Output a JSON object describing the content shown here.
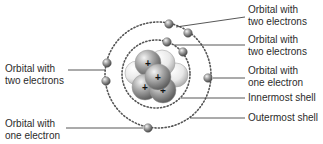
{
  "colors": {
    "line": "#444444",
    "shell_dots": "#555555",
    "text": "#2b2b2b",
    "proton_dark": "#8a8a8a",
    "neutron_light": "#e2e2e2",
    "electron": "#8c8c8c"
  },
  "shells": [
    {
      "name": "innermost-shell",
      "cx": 156,
      "cy": 74,
      "r": 34
    },
    {
      "name": "outermost-shell",
      "cx": 158,
      "cy": 75,
      "r": 53
    }
  ],
  "nucleus": {
    "particles": [
      {
        "type": "neutron",
        "cx": 137,
        "cy": 73,
        "r": 12
      },
      {
        "type": "neutron",
        "cx": 176,
        "cy": 75,
        "r": 12
      },
      {
        "type": "neutron",
        "cx": 162,
        "cy": 63,
        "r": 13
      },
      {
        "type": "proton",
        "cx": 148,
        "cy": 63,
        "r": 13,
        "symbol": "+"
      },
      {
        "type": "proton",
        "cx": 145,
        "cy": 87,
        "r": 13,
        "symbol": "+"
      },
      {
        "type": "proton",
        "cx": 163,
        "cy": 90,
        "r": 13,
        "symbol": "+"
      },
      {
        "type": "proton",
        "cx": 158,
        "cy": 77,
        "r": 13,
        "symbol": "+"
      }
    ]
  },
  "electrons": [
    {
      "cx": 169,
      "cy": 24
    },
    {
      "cx": 188,
      "cy": 33
    },
    {
      "cx": 167,
      "cy": 42
    },
    {
      "cx": 183,
      "cy": 52
    },
    {
      "cx": 107,
      "cy": 63
    },
    {
      "cx": 106,
      "cy": 81
    },
    {
      "cx": 208,
      "cy": 78
    },
    {
      "cx": 148,
      "cy": 128
    }
  ],
  "labels": {
    "right": [
      {
        "line1": "Orbital with",
        "line2": "two electrons",
        "x": 248,
        "y": 4
      },
      {
        "line1": "Orbital with",
        "line2": "two electrons",
        "x": 248,
        "y": 34
      },
      {
        "line1": "Orbital with",
        "line2": "one electron",
        "x": 248,
        "y": 65
      },
      {
        "line1": "Innermost shell",
        "line2": "",
        "x": 248,
        "y": 92
      },
      {
        "line1": "Outermost shell",
        "line2": "",
        "x": 248,
        "y": 112
      }
    ],
    "left": [
      {
        "line1": "Orbital with",
        "line2": "two electrons",
        "x": 5,
        "y": 63
      },
      {
        "line1": "Orbital with",
        "line2": "one electron",
        "x": 5,
        "y": 118
      }
    ]
  },
  "leader_lines": [
    {
      "x1": 176,
      "y1": 27,
      "x2": 245,
      "y2": 17
    },
    {
      "x1": 174,
      "y1": 45,
      "x2": 245,
      "y2": 45
    },
    {
      "x1": 213,
      "y1": 78,
      "x2": 245,
      "y2": 78
    },
    {
      "x1": 181,
      "y1": 98,
      "x2": 245,
      "y2": 98
    },
    {
      "x1": 190,
      "y1": 118,
      "x2": 245,
      "y2": 118
    },
    {
      "x1": 68,
      "y1": 70,
      "x2": 105,
      "y2": 70
    },
    {
      "x1": 66,
      "y1": 128,
      "x2": 143,
      "y2": 128
    }
  ]
}
